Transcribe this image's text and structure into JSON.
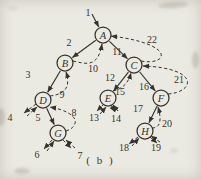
{
  "figure": {
    "caption": "( b )"
  },
  "colors": {
    "ink": "#35332c",
    "paper": "#ebeae2"
  },
  "graph": {
    "description": "depth-first traversal order of a tree",
    "nodes": [
      {
        "id": "A",
        "label": "A",
        "x": 103,
        "y": 35,
        "r": 8
      },
      {
        "id": "B",
        "label": "B",
        "x": 65,
        "y": 63,
        "r": 8
      },
      {
        "id": "C",
        "label": "C",
        "x": 134,
        "y": 65,
        "r": 8
      },
      {
        "id": "D",
        "label": "D",
        "x": 43,
        "y": 100,
        "r": 8
      },
      {
        "id": "E",
        "label": "E",
        "x": 108,
        "y": 98,
        "r": 8
      },
      {
        "id": "F",
        "label": "F",
        "x": 161,
        "y": 98,
        "r": 8
      },
      {
        "id": "G",
        "label": "G",
        "x": 58,
        "y": 133,
        "r": 8
      },
      {
        "id": "H",
        "label": "H",
        "x": 145,
        "y": 131,
        "r": 8
      }
    ],
    "edges": [
      {
        "name": "edge-step-1",
        "dashed": false,
        "from_point": [
          92,
          14
        ],
        "to": "A"
      },
      {
        "name": "edge-step-2",
        "dashed": false,
        "from": "A",
        "to": "B"
      },
      {
        "name": "edge-step-3",
        "dashed": false,
        "from": "B",
        "to": "D"
      },
      {
        "name": "edge-step-5",
        "dashed": false,
        "from": "D",
        "to": "G"
      },
      {
        "name": "edge-step-11",
        "dashed": false,
        "from": "A",
        "to": "C"
      },
      {
        "name": "edge-step-12",
        "dashed": false,
        "from": "C",
        "to": "E"
      },
      {
        "name": "edge-step-16",
        "dashed": false,
        "from": "C",
        "to": "F"
      },
      {
        "name": "edge-step-17",
        "dashed": false,
        "from": "F",
        "to": "H"
      },
      {
        "name": "edge-step-4-down",
        "dashed": true,
        "d": "M 36,104 L 24,113"
      },
      {
        "name": "edge-step-4-up",
        "dashed": true,
        "d": "M 27,116 L 37,107"
      },
      {
        "name": "edge-step-6-down",
        "dashed": true,
        "d": "M 52,140 L 44,149"
      },
      {
        "name": "edge-step-6-up",
        "dashed": true,
        "d": "M 47,151 L 54,141"
      },
      {
        "name": "edge-step-7-down",
        "dashed": true,
        "d": "M 63,140 L 71,148"
      },
      {
        "name": "edge-step-7-up",
        "dashed": true,
        "d": "M 75,148 L 66,140"
      },
      {
        "name": "edge-step-8",
        "dashed": true,
        "d": "M 66,131 C 79,127 82,113 50,107"
      },
      {
        "name": "edge-step-9",
        "dashed": true,
        "d": "M 50,96 C 68,94 70,84 66,72"
      },
      {
        "name": "edge-step-10",
        "dashed": true,
        "d": "M 73,61 C 86,64 98,68 102,44"
      },
      {
        "name": "edge-step-13-down",
        "dashed": true,
        "d": "M 104,104 L 97,111"
      },
      {
        "name": "edge-step-13-up",
        "dashed": true,
        "d": "M 100,114 L 106,107"
      },
      {
        "name": "edge-step-14-down",
        "dashed": true,
        "d": "M 111,105 L 115,112"
      },
      {
        "name": "edge-step-14-up",
        "dashed": true,
        "d": "M 118,111 L 113,105"
      },
      {
        "name": "edge-step-15",
        "dashed": true,
        "d": "M 113,91 C 122,89 128,84 131,73"
      },
      {
        "name": "edge-step-18-down",
        "dashed": true,
        "d": "M 138,137 L 129,144"
      },
      {
        "name": "edge-step-18-up",
        "dashed": true,
        "d": "M 132,146 L 139,138"
      },
      {
        "name": "edge-step-19-down",
        "dashed": true,
        "d": "M 150,137 L 157,143"
      },
      {
        "name": "edge-step-19-up",
        "dashed": true,
        "d": "M 160,142 L 151,136"
      },
      {
        "name": "edge-step-20",
        "dashed": true,
        "d": "M 152,128 C 162,128 161,117 158,107"
      },
      {
        "name": "edge-step-21",
        "dashed": true,
        "d": "M 168,94 C 195,92 200,68 143,66"
      },
      {
        "name": "edge-step-22",
        "dashed": true,
        "d": "M 141,61 C 168,66 177,44 111,36"
      }
    ],
    "step_labels": [
      {
        "text": "1",
        "x": 88,
        "y": 12
      },
      {
        "text": "2",
        "x": 69,
        "y": 42
      },
      {
        "text": "3",
        "x": 28,
        "y": 74
      },
      {
        "text": "4",
        "x": 10,
        "y": 117
      },
      {
        "text": "5",
        "x": 38,
        "y": 117
      },
      {
        "text": "6",
        "x": 37,
        "y": 154
      },
      {
        "text": "7",
        "x": 80,
        "y": 155
      },
      {
        "text": "8",
        "x": 74,
        "y": 112
      },
      {
        "text": "9",
        "x": 62,
        "y": 94
      },
      {
        "text": "10",
        "x": 93,
        "y": 68
      },
      {
        "text": "11",
        "x": 117,
        "y": 51
      },
      {
        "text": "12",
        "x": 110,
        "y": 77
      },
      {
        "text": "13",
        "x": 94,
        "y": 117
      },
      {
        "text": "14",
        "x": 116,
        "y": 118
      },
      {
        "text": "15",
        "x": 120,
        "y": 91
      },
      {
        "text": "16",
        "x": 144,
        "y": 86
      },
      {
        "text": "17",
        "x": 138,
        "y": 108
      },
      {
        "text": "18",
        "x": 124,
        "y": 147
      },
      {
        "text": "19",
        "x": 156,
        "y": 147
      },
      {
        "text": "20",
        "x": 167,
        "y": 123
      },
      {
        "text": "21",
        "x": 179,
        "y": 79
      },
      {
        "text": "22",
        "x": 152,
        "y": 39
      }
    ]
  }
}
